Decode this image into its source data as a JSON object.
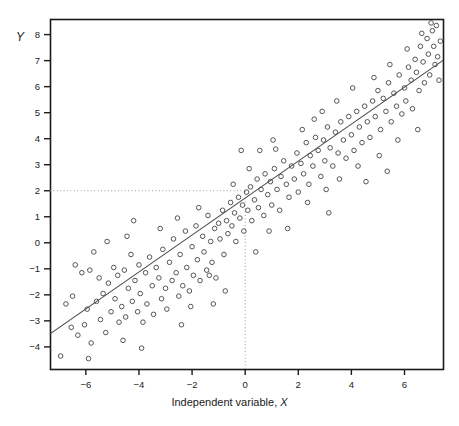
{
  "figure": {
    "background": "#ffffff",
    "plot_box": {
      "left": 50,
      "top": 19,
      "right": 443,
      "bottom": 369
    },
    "axis_color": "#1a1a1a",
    "point_color": "#555555",
    "line_color": "#4a4a4a",
    "guide_color": "#9a9a9a"
  },
  "labels": {
    "x_title_prefix": "Independent variable, ",
    "x_title_var": "X",
    "y_title": "Y"
  },
  "chart_data": {
    "type": "scatter",
    "title": "",
    "xlabel": "Independent variable, X",
    "ylabel": "Y",
    "xlim": [
      -7.35,
      7.45
    ],
    "ylim": [
      -4.85,
      8.6
    ],
    "xticks": [
      -6,
      -4,
      -2,
      0,
      2,
      4,
      6
    ],
    "xticklabels": [
      "−6",
      "−4",
      "−2",
      "0",
      "2",
      "4",
      "6"
    ],
    "yticks": [
      -4,
      -3,
      -2,
      -1,
      0,
      1,
      2,
      3,
      4,
      5,
      6,
      7,
      8
    ],
    "yticklabels": [
      "−4",
      "−3",
      "−2",
      "−1",
      "0",
      "1",
      "2",
      "3",
      "4",
      "5",
      "6",
      "7",
      "8"
    ],
    "grid": false,
    "legend": null,
    "marker": {
      "shape": "open-circle",
      "size_px": 4.6,
      "stroke_width": 1.0
    },
    "regression_line": {
      "slope": 0.71,
      "intercept": 1.72,
      "x_start": -7.35,
      "y_start": -3.5,
      "x_end": 7.45,
      "y_end": 7.01
    },
    "reference_lines": [
      {
        "orientation": "horizontal",
        "value": 2,
        "x_from": -7.35,
        "x_to": 0,
        "style": "dotted"
      },
      {
        "orientation": "vertical",
        "value": 0,
        "y_from": -4.85,
        "y_to": 2,
        "style": "dotted"
      }
    ],
    "points": [
      [
        -6.95,
        -4.35
      ],
      [
        -6.75,
        -2.35
      ],
      [
        -6.55,
        -3.25
      ],
      [
        -6.5,
        -2.05
      ],
      [
        -6.3,
        -3.55
      ],
      [
        -6.15,
        -1.15
      ],
      [
        -6.05,
        -3.15
      ],
      [
        -5.95,
        -2.55
      ],
      [
        -5.85,
        -1.05
      ],
      [
        -5.8,
        -3.85
      ],
      [
        -5.6,
        -2.25
      ],
      [
        -5.5,
        -1.35
      ],
      [
        -5.45,
        -2.95
      ],
      [
        -5.35,
        -1.95
      ],
      [
        -5.25,
        -3.45
      ],
      [
        -5.15,
        -1.55
      ],
      [
        -5.05,
        -2.65
      ],
      [
        -4.95,
        -0.95
      ],
      [
        -4.9,
        -2.15
      ],
      [
        -4.8,
        -1.25
      ],
      [
        -4.75,
        -3.05
      ],
      [
        -4.65,
        -2.45
      ],
      [
        -4.55,
        -1.05
      ],
      [
        -4.5,
        -2.85
      ],
      [
        -4.4,
        -1.75
      ],
      [
        -4.3,
        -0.45
      ],
      [
        -4.25,
        -2.25
      ],
      [
        -4.15,
        -1.45
      ],
      [
        -4.05,
        -2.65
      ],
      [
        -4.0,
        -0.85
      ],
      [
        -3.95,
        -1.95
      ],
      [
        -3.85,
        -3.05
      ],
      [
        -3.75,
        -1.15
      ],
      [
        -3.7,
        -2.35
      ],
      [
        -3.6,
        -0.55
      ],
      [
        -3.5,
        -1.65
      ],
      [
        -3.45,
        -2.75
      ],
      [
        -3.35,
        -0.95
      ],
      [
        -3.25,
        -1.35
      ],
      [
        -3.15,
        -2.15
      ],
      [
        -3.1,
        -0.25
      ],
      [
        -3.0,
        -1.75
      ],
      [
        -2.95,
        -2.55
      ],
      [
        -2.85,
        -0.75
      ],
      [
        -2.75,
        -1.45
      ],
      [
        -2.7,
        0.15
      ],
      [
        -2.6,
        -1.15
      ],
      [
        -2.5,
        -2.05
      ],
      [
        -2.45,
        -0.45
      ],
      [
        -2.35,
        -1.65
      ],
      [
        -2.25,
        0.45
      ],
      [
        -2.2,
        -0.95
      ],
      [
        -2.1,
        -1.85
      ],
      [
        -2.0,
        -0.15
      ],
      [
        -1.95,
        -1.25
      ],
      [
        -1.85,
        0.65
      ],
      [
        -1.8,
        -0.65
      ],
      [
        -1.7,
        -1.45
      ],
      [
        -1.6,
        0.25
      ],
      [
        -1.55,
        -0.35
      ],
      [
        -1.45,
        -1.05
      ],
      [
        -1.4,
        1.05
      ],
      [
        -1.3,
        0.05
      ],
      [
        -1.25,
        -0.75
      ],
      [
        -1.15,
        0.55
      ],
      [
        -1.1,
        -1.35
      ],
      [
        -1.0,
        0.75
      ],
      [
        -0.95,
        0.15
      ],
      [
        -0.85,
        1.25
      ],
      [
        -0.8,
        -0.45
      ],
      [
        -0.7,
        0.85
      ],
      [
        -0.65,
        0.35
      ],
      [
        -0.55,
        1.55
      ],
      [
        -0.5,
        0.65
      ],
      [
        -0.4,
        1.15
      ],
      [
        -0.35,
        0.05
      ],
      [
        -0.25,
        1.75
      ],
      [
        -0.2,
        0.95
      ],
      [
        -0.1,
        1.45
      ],
      [
        -0.05,
        0.45
      ],
      [
        0.05,
        1.95
      ],
      [
        0.1,
        1.25
      ],
      [
        0.2,
        2.15
      ],
      [
        0.25,
        0.85
      ],
      [
        0.35,
        1.65
      ],
      [
        0.45,
        2.45
      ],
      [
        0.5,
        1.35
      ],
      [
        0.6,
        2.05
      ],
      [
        0.7,
        1.05
      ],
      [
        0.75,
        2.65
      ],
      [
        0.85,
        1.85
      ],
      [
        0.95,
        2.35
      ],
      [
        1.0,
        1.45
      ],
      [
        1.1,
        2.85
      ],
      [
        1.2,
        2.05
      ],
      [
        1.3,
        1.25
      ],
      [
        1.35,
        2.55
      ],
      [
        1.45,
        3.15
      ],
      [
        1.55,
        2.25
      ],
      [
        1.65,
        1.75
      ],
      [
        1.75,
        2.95
      ],
      [
        1.85,
        2.45
      ],
      [
        1.95,
        3.45
      ],
      [
        2.0,
        1.95
      ],
      [
        2.1,
        3.05
      ],
      [
        2.2,
        2.65
      ],
      [
        2.3,
        3.85
      ],
      [
        2.4,
        2.25
      ],
      [
        2.45,
        3.35
      ],
      [
        2.55,
        2.95
      ],
      [
        2.65,
        4.05
      ],
      [
        2.75,
        3.55
      ],
      [
        2.85,
        2.55
      ],
      [
        2.95,
        3.95
      ],
      [
        3.0,
        3.15
      ],
      [
        3.1,
        4.45
      ],
      [
        3.2,
        3.65
      ],
      [
        3.3,
        2.95
      ],
      [
        3.4,
        4.25
      ],
      [
        3.5,
        3.45
      ],
      [
        3.6,
        4.65
      ],
      [
        3.7,
        3.95
      ],
      [
        3.8,
        3.25
      ],
      [
        3.9,
        4.85
      ],
      [
        4.0,
        4.15
      ],
      [
        4.1,
        3.55
      ],
      [
        4.2,
        5.05
      ],
      [
        4.3,
        4.45
      ],
      [
        4.4,
        3.85
      ],
      [
        4.5,
        5.25
      ],
      [
        4.6,
        4.65
      ],
      [
        4.7,
        4.05
      ],
      [
        4.8,
        5.45
      ],
      [
        4.9,
        4.85
      ],
      [
        5.0,
        5.85
      ],
      [
        5.1,
        4.35
      ],
      [
        5.2,
        5.55
      ],
      [
        5.3,
        5.05
      ],
      [
        5.4,
        6.15
      ],
      [
        5.5,
        4.65
      ],
      [
        5.6,
        5.75
      ],
      [
        5.7,
        5.25
      ],
      [
        5.8,
        6.45
      ],
      [
        5.9,
        4.95
      ],
      [
        6.0,
        5.95
      ],
      [
        6.05,
        5.45
      ],
      [
        6.15,
        6.75
      ],
      [
        6.25,
        6.25
      ],
      [
        6.3,
        5.15
      ],
      [
        6.4,
        7.05
      ],
      [
        6.45,
        6.55
      ],
      [
        6.55,
        5.85
      ],
      [
        6.6,
        7.55
      ],
      [
        6.7,
        6.95
      ],
      [
        6.75,
        6.15
      ],
      [
        6.85,
        7.85
      ],
      [
        6.9,
        7.25
      ],
      [
        6.95,
        6.45
      ],
      [
        7.05,
        8.15
      ],
      [
        7.1,
        7.55
      ],
      [
        7.15,
        6.85
      ],
      [
        7.2,
        8.35
      ],
      [
        7.25,
        7.15
      ],
      [
        7.3,
        6.25
      ],
      [
        7.35,
        7.75
      ],
      [
        -0.15,
        3.55
      ],
      [
        0.55,
        3.55
      ],
      [
        1.15,
        3.6
      ],
      [
        -1.35,
        -1.25
      ],
      [
        -2.05,
        -2.45
      ],
      [
        2.35,
        1.55
      ],
      [
        3.05,
        2.05
      ],
      [
        3.55,
        2.45
      ],
      [
        1.6,
        0.55
      ],
      [
        0.9,
        0.45
      ],
      [
        -3.2,
        0.55
      ],
      [
        -4.45,
        0.25
      ],
      [
        -5.2,
        0.05
      ],
      [
        -2.55,
        0.95
      ],
      [
        -1.75,
        1.35
      ],
      [
        4.25,
        2.95
      ],
      [
        5.05,
        3.35
      ],
      [
        5.75,
        3.95
      ],
      [
        6.5,
        4.35
      ],
      [
        2.9,
        5.05
      ],
      [
        3.45,
        5.45
      ],
      [
        4.05,
        5.95
      ],
      [
        4.85,
        6.35
      ],
      [
        5.45,
        6.85
      ],
      [
        6.1,
        7.45
      ],
      [
        6.65,
        8.05
      ],
      [
        7.0,
        8.45
      ],
      [
        -6.4,
        -0.85
      ],
      [
        -5.7,
        -0.35
      ],
      [
        -4.2,
        0.85
      ],
      [
        -0.45,
        2.25
      ],
      [
        0.15,
        2.85
      ],
      [
        1.05,
        3.95
      ],
      [
        2.15,
        4.35
      ],
      [
        2.6,
        4.75
      ],
      [
        3.15,
        1.15
      ],
      [
        4.55,
        2.35
      ],
      [
        5.35,
        2.75
      ],
      [
        -3.9,
        -4.05
      ],
      [
        -4.6,
        -3.75
      ],
      [
        -5.9,
        -4.45
      ],
      [
        -2.4,
        -3.15
      ],
      [
        -1.2,
        -2.35
      ],
      [
        -0.75,
        -1.85
      ],
      [
        0.4,
        -0.35
      ]
    ]
  }
}
